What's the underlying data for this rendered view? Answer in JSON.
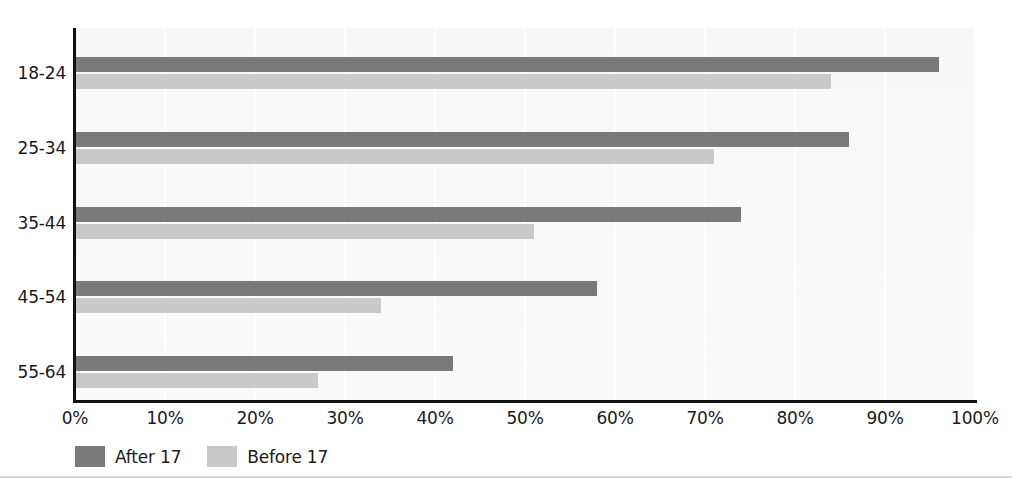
{
  "chart_data": {
    "type": "bar",
    "orientation": "horizontal",
    "title": "",
    "xlabel": "",
    "ylabel": "",
    "xlim": [
      0,
      100
    ],
    "xunit": "%",
    "grid": true,
    "legend_position": "bottom-left",
    "categories": [
      "18-24",
      "25-34",
      "35-44",
      "45-54",
      "55-64"
    ],
    "xticks": [
      "0%",
      "10%",
      "20%",
      "30%",
      "40%",
      "50%",
      "60%",
      "70%",
      "80%",
      "90%",
      "100%"
    ],
    "xtick_values": [
      0,
      10,
      20,
      30,
      40,
      50,
      60,
      70,
      80,
      90,
      100
    ],
    "series": [
      {
        "name": "After 17",
        "color": "#7a7a7a",
        "values": [
          96,
          86,
          74,
          58,
          42
        ]
      },
      {
        "name": "Before 17",
        "color": "#c9c9c9",
        "values": [
          84,
          71,
          51,
          34,
          27
        ]
      }
    ]
  },
  "colors": {
    "after": "#7a7a7a",
    "before": "#c9c9c9",
    "axis": "#111111",
    "grid": "#ffffff",
    "plot_background": "#f9f9f9",
    "text": "#1a1a1a"
  }
}
